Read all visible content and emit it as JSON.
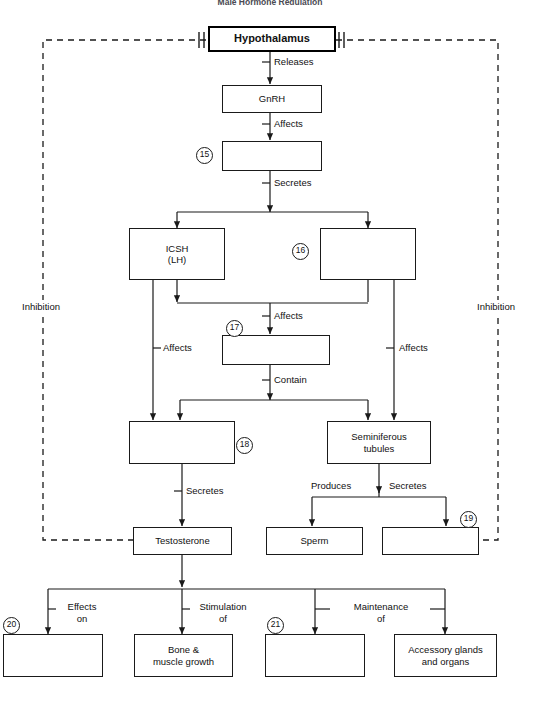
{
  "title": "Male Hormone Regulation",
  "colors": {
    "stroke": "#1a1a1a",
    "emphasis_stroke": "#000000",
    "background": "#ffffff",
    "title_color": "#4a4a52"
  },
  "nodes": {
    "hypothalamus": {
      "label": "Hypothalamus"
    },
    "gnrh": {
      "label": "GnRH"
    },
    "blank15": {
      "label": ""
    },
    "icsh": {
      "label": "ICSH\n(LH)",
      "line1": "ICSH",
      "line2": "(LH)"
    },
    "blank16": {
      "label": ""
    },
    "blank17": {
      "label": ""
    },
    "blank18": {
      "label": ""
    },
    "seminiferous": {
      "label": "Seminiferous\ntubules",
      "line1": "Seminiferous",
      "line2": "tubules"
    },
    "testosterone": {
      "label": "Testosterone"
    },
    "sperm": {
      "label": "Sperm"
    },
    "blank19": {
      "label": ""
    },
    "blank20": {
      "label": ""
    },
    "bone_muscle": {
      "label": "Bone &\nmuscle growth",
      "line1": "Bone &",
      "line2": "muscle growth"
    },
    "blank21": {
      "label": ""
    },
    "accessory": {
      "label": "Accessory glands\nand organs",
      "line1": "Accessory glands",
      "line2": "and organs"
    }
  },
  "markers": [
    {
      "id": "m15",
      "number": "15"
    },
    {
      "id": "m16",
      "number": "16"
    },
    {
      "id": "m17",
      "number": "17"
    },
    {
      "id": "m18",
      "number": "18"
    },
    {
      "id": "m19",
      "number": "19"
    },
    {
      "id": "m20",
      "number": "20"
    },
    {
      "id": "m21",
      "number": "21"
    }
  ],
  "edge_labels": {
    "releases": "Releases",
    "affects_gnrh": "Affects",
    "secretes_pituitary": "Secretes",
    "affects_center": "Affects",
    "affects_left": "Affects",
    "affects_right": "Affects",
    "contain": "Contain",
    "secretes_testosterone": "Secretes",
    "produces": "Produces",
    "secretes_sperm": "Secretes",
    "effects_on_1": "Effects",
    "effects_on_2": "on",
    "stimulation_of_1": "Stimulation",
    "stimulation_of_2": "of",
    "maintenance_of_1": "Maintenance",
    "maintenance_of_2": "of"
  },
  "feedback": {
    "left_label": "Inhibition",
    "right_label": "Inhibition"
  }
}
